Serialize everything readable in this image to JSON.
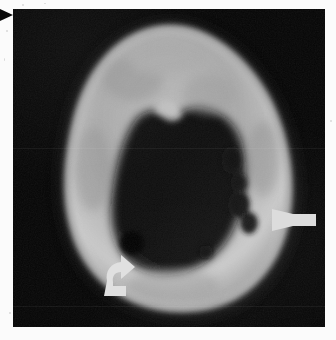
{
  "figure": {
    "modality_label": "axial-ct-bone-window",
    "panel_background": "#050505",
    "page_background": "#fbfbfb",
    "annotation_color": "#e8e8e8",
    "pointer_color": "#0a0a0a",
    "panel": {
      "x": 13,
      "y": 9,
      "width": 312,
      "height": 318
    }
  },
  "annotations": {
    "straight_arrow": {
      "name": "cortical-lesion-arrow",
      "direction": "left",
      "color": "#dcdcdc",
      "tip_x": 272,
      "tip_y": 220,
      "tail_x": 316
    },
    "curved_arrow": {
      "name": "periosteal-reaction-curved-arrow",
      "direction": "up-right-hooked",
      "color": "#e0e0e0",
      "x": 90,
      "y": 258,
      "width": 36,
      "height": 38
    },
    "margin_pointer": {
      "name": "figure-margin-pointer",
      "shape": "solid-triangle-right",
      "color": "#0a0a0a",
      "x": 0,
      "y": 8,
      "size": 14
    }
  },
  "anatomy": {
    "structure": "tubular bone cross-section",
    "cortex_label": "cortical bone",
    "medulla_label": "medullary canal",
    "lesions": [
      {
        "name": "cortical-lucency-posterolateral-upper",
        "cx": 232,
        "cy": 160,
        "rx": 9,
        "ry": 11
      },
      {
        "name": "cortical-lucency-posterolateral-mid",
        "cx": 240,
        "cy": 183,
        "rx": 8,
        "ry": 9
      },
      {
        "name": "cortical-lucency-lateral-arrowed",
        "cx": 240,
        "cy": 205,
        "rx": 10,
        "ry": 13
      },
      {
        "name": "cortical-lucency-lateral-distal",
        "cx": 248,
        "cy": 222,
        "rx": 8,
        "ry": 10
      },
      {
        "name": "cortical-lucency-inferomedial-large",
        "cx": 132,
        "cy": 243,
        "rx": 12,
        "ry": 12
      },
      {
        "name": "cortical-lucency-inferior-small",
        "cx": 206,
        "cy": 252,
        "rx": 7,
        "ry": 7
      }
    ]
  },
  "chart_data": {
    "type": "heatmap",
    "title": "",
    "xlabel": "",
    "ylabel": "",
    "grid": false,
    "legend": "none"
  }
}
